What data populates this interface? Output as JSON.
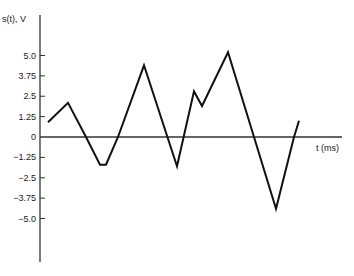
{
  "chart_data": {
    "type": "line",
    "title": "",
    "xlabel": "t (ms)",
    "ylabel": "s(t), V",
    "y_ticks": [
      5.0,
      3.75,
      2.5,
      1.25,
      0,
      -1.25,
      -2.5,
      -3.75,
      -5.0
    ],
    "y_tick_labels": [
      "5.0",
      "3.75",
      "2.5",
      "1.25",
      "0",
      "-1.25",
      "-2.5",
      "-3.75",
      "-5.0"
    ],
    "x_ticks": [],
    "ylim": [
      -7.6,
      7.8
    ],
    "grid": false,
    "legend": null,
    "series": [
      {
        "name": "s(t)",
        "x": [
          0,
          1.0,
          1.9,
          2.6,
          2.9,
          3.5,
          4.8,
          6.45,
          7.3,
          7.7,
          9.0,
          10.3,
          11.4,
          12.3,
          12.55
        ],
        "values": [
          0.9,
          2.1,
          0,
          -1.7,
          -1.7,
          0,
          4.4,
          -1.8,
          2.8,
          1.9,
          5.2,
          0,
          -4.4,
          0,
          1.0
        ]
      }
    ]
  },
  "layout": {
    "origin_px": [
      40,
      137
    ],
    "y_px_per_unit": 16.3,
    "x_px_per_unit": 20,
    "x_offset_px": 8,
    "y_axis_top_px": 15,
    "y_axis_bottom_px": 262,
    "x_axis_end_px": 342,
    "line_color": "#111111",
    "axis_color": "#333333"
  }
}
